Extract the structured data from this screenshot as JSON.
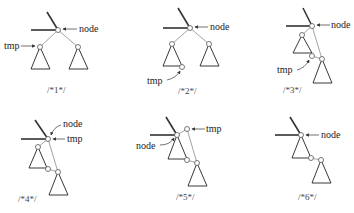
{
  "panels": [
    {
      "id": 1,
      "caption": "/*1*/",
      "labels": {
        "node": "node",
        "tmp": "tmp"
      }
    },
    {
      "id": 2,
      "caption": "/*2*/",
      "labels": {
        "node": "node",
        "tmp": "tmp"
      }
    },
    {
      "id": 3,
      "caption": "/*3*/",
      "labels": {
        "node": "node",
        "tmp": "tmp"
      }
    },
    {
      "id": 4,
      "caption": "/*4*/",
      "labels": {
        "node": "node",
        "tmp": "tmp"
      }
    },
    {
      "id": 5,
      "caption": "/*5*/",
      "labels": {
        "node": "node",
        "tmp": "tmp"
      }
    },
    {
      "id": 6,
      "caption": "/*6*/",
      "labels": {
        "node": "node"
      }
    }
  ]
}
